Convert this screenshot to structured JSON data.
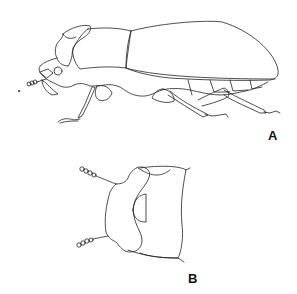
{
  "figure": {
    "panels": [
      {
        "id": "A",
        "label": "A",
        "description": "Beetle, lateral view"
      },
      {
        "id": "B",
        "label": "B",
        "description": "Head and pronotum, dorsal view"
      }
    ],
    "colors": {
      "line": "#222222",
      "background": "#ffffff"
    }
  }
}
